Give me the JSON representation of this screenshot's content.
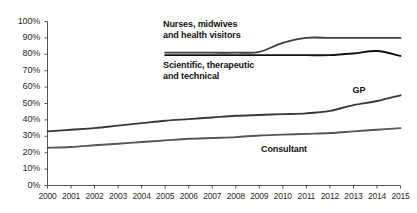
{
  "chart_data": {
    "type": "line",
    "title": "",
    "subtitle": "",
    "xlabel": "",
    "ylabel": "",
    "x": [
      2000,
      2001,
      2002,
      2003,
      2004,
      2005,
      2006,
      2007,
      2008,
      2009,
      2010,
      2011,
      2012,
      2013,
      2014,
      2015
    ],
    "xtick_labels": [
      "2000",
      "2001",
      "2002",
      "2003",
      "2004",
      "2005",
      "2006",
      "2007",
      "2008",
      "2009",
      "2010",
      "2011",
      "2012",
      "2013",
      "2014",
      "2015"
    ],
    "ytick_labels": [
      "0%",
      "10%",
      "20%",
      "30%",
      "40%",
      "50%",
      "60%",
      "70%",
      "80%",
      "90%",
      "100%"
    ],
    "ytick_values": [
      0,
      10,
      20,
      30,
      40,
      50,
      60,
      70,
      80,
      90,
      100
    ],
    "ylim": [
      0,
      100
    ],
    "xlim": [
      2000,
      2015
    ],
    "grid": false,
    "legend": "inline-annotations",
    "series": [
      {
        "name": "Nurses, midwives and health visitors",
        "annotation": "Nurses, midwives\nand health visitors",
        "color": "#3f3f3f",
        "x": [
          2005,
          2006,
          2007,
          2008,
          2009,
          2010,
          2011,
          2012,
          2013,
          2014,
          2015
        ],
        "values": [
          81,
          81,
          81,
          81,
          81.5,
          87,
          90,
          90,
          90,
          90,
          90
        ]
      },
      {
        "name": "Scientific, therapeutic and technical",
        "annotation": "Scientific, therapeutic\nand technical",
        "color": "#111111",
        "x": [
          2005,
          2006,
          2007,
          2008,
          2009,
          2010,
          2011,
          2012,
          2013,
          2014,
          2015
        ],
        "values": [
          79.5,
          79.5,
          79.5,
          79.5,
          79.5,
          79.5,
          79.5,
          79.5,
          80.5,
          82,
          79
        ]
      },
      {
        "name": "GP",
        "annotation": "GP",
        "color": "#3a3a3a",
        "x": [
          2000,
          2001,
          2002,
          2003,
          2004,
          2005,
          2006,
          2007,
          2008,
          2009,
          2010,
          2011,
          2012,
          2013,
          2014,
          2015
        ],
        "values": [
          33,
          34,
          35,
          36.5,
          38,
          39.5,
          40.5,
          41.5,
          42.5,
          43,
          43.5,
          44,
          45.5,
          49,
          51.5,
          55
        ]
      },
      {
        "name": "Consultant",
        "annotation": "Consultant",
        "color": "#555555",
        "x": [
          2000,
          2001,
          2002,
          2003,
          2004,
          2005,
          2006,
          2007,
          2008,
          2009,
          2010,
          2011,
          2012,
          2013,
          2014,
          2015
        ],
        "values": [
          23,
          23.5,
          24.5,
          25.5,
          26.5,
          27.5,
          28.5,
          29,
          29.5,
          30.5,
          31,
          31.5,
          32,
          33,
          34,
          35
        ]
      }
    ],
    "annotations": [
      {
        "id": "nurses",
        "line1": "Nurses, midwives",
        "line2": "and health visitors"
      },
      {
        "id": "scientific",
        "line1": "Scientific, therapeutic",
        "line2": "and technical"
      },
      {
        "id": "gp",
        "line1": "GP",
        "line2": ""
      },
      {
        "id": "consultant",
        "line1": "Consultant",
        "line2": ""
      }
    ],
    "axis_color": "#555555"
  }
}
